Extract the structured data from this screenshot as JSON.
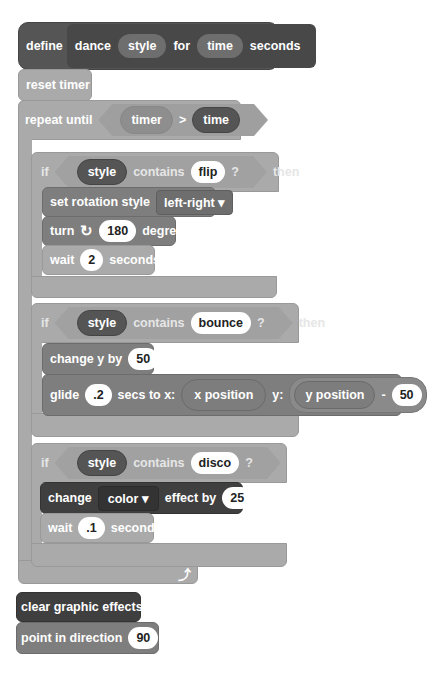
{
  "define_block": {
    "keyword": "define",
    "name": "dance",
    "param1": "style",
    "word_for": "for",
    "param2": "time",
    "word_seconds": "seconds"
  },
  "reset_timer": {
    "label": "reset timer"
  },
  "repeat_until": {
    "label": "repeat until",
    "left": "timer",
    "operator": ">",
    "right": "time",
    "loop_icon": "loop-arrow-icon"
  },
  "if_flip": {
    "if_label": "if",
    "var": "style",
    "contains": "contains",
    "value": "flip",
    "question": "?",
    "then": "then",
    "body": {
      "set_rotation": {
        "label": "set rotation style",
        "value": "left-right",
        "arrow": "▾"
      },
      "turn": {
        "label": "turn",
        "icon": "rotate-clockwise-icon",
        "value": "180",
        "suffix": "degrees"
      },
      "wait": {
        "label": "wait",
        "value": "2",
        "suffix": "seconds"
      }
    }
  },
  "if_bounce": {
    "if_label": "if",
    "var": "style",
    "contains": "contains",
    "value": "bounce",
    "question": "?",
    "then": "then",
    "body": {
      "change_y": {
        "label": "change y by",
        "value": "50"
      },
      "glide": {
        "label": "glide",
        "secs": ".2",
        "mid": "secs to x:",
        "x": "x position",
        "ylabel": "y:",
        "y": "y position",
        "op": "-",
        "yval": "50"
      }
    }
  },
  "if_disco": {
    "if_label": "if",
    "var": "style",
    "contains": "contains",
    "value": "disco",
    "question": "?",
    "body": {
      "change_effect": {
        "label": "change",
        "effect": "color",
        "arrow": "▾",
        "mid": "effect by",
        "value": "25"
      },
      "wait": {
        "label": "wait",
        "value": ".1",
        "suffix": "seconds"
      }
    }
  },
  "clear_effects": {
    "label": "clear graphic effects"
  },
  "point_direction": {
    "label": "point in direction",
    "value": "90"
  }
}
